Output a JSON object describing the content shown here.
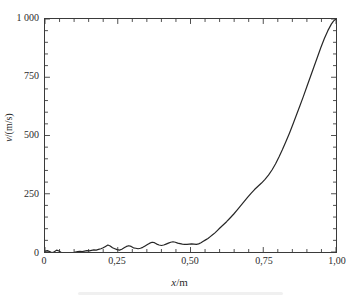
{
  "figure": {
    "background_color": "#ffffff",
    "axis_color": "#3a3a3a",
    "line_color": "#262626",
    "text_color": "#2b2b2b"
  },
  "axis_labels": {
    "x_prefix": "x",
    "x_suffix": "/m",
    "y_prefix": "v",
    "y_suffix": "/(m/s)"
  },
  "ticks": {
    "x_major_labels": [
      "0",
      "0,25",
      "0,50",
      "0,75",
      "1,00"
    ],
    "y_major_labels": [
      "0",
      "250",
      "500",
      "750",
      "1 000"
    ]
  },
  "chart_data": {
    "type": "line",
    "title": "",
    "subtitle": "",
    "xlabel": "x/m",
    "ylabel": "v/(m/s)",
    "xlim": [
      0,
      1.0
    ],
    "ylim": [
      0,
      1000
    ],
    "grid": false,
    "legend": null,
    "x_major_ticks": [
      0,
      0.25,
      0.5,
      0.75,
      1.0
    ],
    "y_major_ticks": [
      0,
      250,
      500,
      750,
      1000
    ],
    "x_minor_subdivisions": 5,
    "y_minor_subdivisions": 5,
    "tick_direction": "in",
    "frame": "box",
    "series": [
      {
        "name": "v(x)",
        "color": "#262626",
        "line_width": 1.2,
        "x": [
          0.0,
          0.008,
          0.016,
          0.024,
          0.032,
          0.04,
          0.048,
          0.056,
          0.064,
          0.072,
          0.08,
          0.088,
          0.096,
          0.104,
          0.112,
          0.12,
          0.128,
          0.136,
          0.144,
          0.152,
          0.16,
          0.168,
          0.176,
          0.184,
          0.192,
          0.2,
          0.208,
          0.216,
          0.224,
          0.232,
          0.24,
          0.248,
          0.256,
          0.264,
          0.272,
          0.28,
          0.288,
          0.296,
          0.304,
          0.312,
          0.32,
          0.328,
          0.336,
          0.344,
          0.352,
          0.36,
          0.368,
          0.376,
          0.384,
          0.392,
          0.4,
          0.408,
          0.416,
          0.424,
          0.432,
          0.44,
          0.448,
          0.456,
          0.464,
          0.472,
          0.48,
          0.488,
          0.496,
          0.504,
          0.512,
          0.52,
          0.528,
          0.536,
          0.544,
          0.552,
          0.56,
          0.568,
          0.576,
          0.584,
          0.592,
          0.6,
          0.612,
          0.624,
          0.636,
          0.648,
          0.66,
          0.672,
          0.684,
          0.696,
          0.708,
          0.72,
          0.732,
          0.744,
          0.756,
          0.768,
          0.78,
          0.792,
          0.804,
          0.816,
          0.828,
          0.84,
          0.852,
          0.864,
          0.876,
          0.888,
          0.9,
          0.912,
          0.924,
          0.936,
          0.948,
          0.96,
          0.972,
          0.984,
          0.992,
          1.0
        ],
        "y": [
          4,
          6,
          2,
          -3,
          1,
          8,
          4,
          -2,
          -8,
          -12,
          -14,
          -10,
          -4,
          0,
          2,
          3,
          2,
          4,
          6,
          5,
          7,
          9,
          8,
          11,
          14,
          18,
          24,
          30,
          26,
          18,
          14,
          10,
          8,
          12,
          18,
          24,
          27,
          24,
          18,
          16,
          14,
          16,
          20,
          26,
          32,
          38,
          42,
          40,
          34,
          30,
          28,
          30,
          34,
          38,
          42,
          44,
          42,
          38,
          36,
          34,
          33,
          33,
          34,
          35,
          34,
          33,
          35,
          40,
          46,
          52,
          58,
          66,
          74,
          82,
          92,
          102,
          116,
          130,
          146,
          162,
          180,
          198,
          216,
          234,
          252,
          268,
          282,
          296,
          312,
          330,
          352,
          378,
          408,
          440,
          474,
          510,
          548,
          588,
          628,
          668,
          710,
          752,
          794,
          836,
          878,
          916,
          950,
          978,
          992,
          1000
        ]
      }
    ]
  }
}
